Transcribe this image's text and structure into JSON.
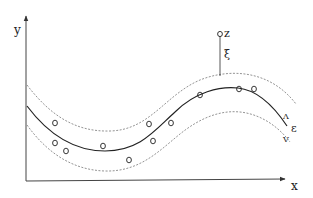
{
  "diagram": {
    "axes": {
      "x_label": "x",
      "y_label": "y"
    },
    "labels": {
      "point_z": "z",
      "distance": "ξ",
      "tube_width": "ε",
      "upper_marker": "Λ",
      "lower_marker": "V"
    },
    "curves": {
      "center": "solid regression curve",
      "upper_bound": "dashed upper ε-tube boundary",
      "lower_bound": "dashed lower ε-tube boundary"
    },
    "points": [
      {
        "x": 55,
        "y": 123
      },
      {
        "x": 55,
        "y": 143
      },
      {
        "x": 66,
        "y": 151
      },
      {
        "x": 103,
        "y": 146
      },
      {
        "x": 129,
        "y": 160
      },
      {
        "x": 149,
        "y": 124
      },
      {
        "x": 153,
        "y": 141
      },
      {
        "x": 171,
        "y": 123
      },
      {
        "x": 200,
        "y": 95
      },
      {
        "x": 239,
        "y": 89
      },
      {
        "x": 254,
        "y": 89
      }
    ],
    "outlier": {
      "x": 220,
      "y": 33
    }
  }
}
